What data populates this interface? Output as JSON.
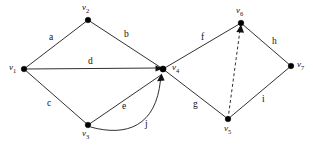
{
  "figure": {
    "type": "graph-diagram",
    "width": 313,
    "height": 150,
    "background_color": "#ffffff",
    "stroke_color": "#1a1a1a"
  },
  "vertices": [
    {
      "id": "v1",
      "name": "v",
      "sub": "1",
      "x": 24,
      "y": 69,
      "label_x": 9,
      "label_y": 63
    },
    {
      "id": "v2",
      "name": "v",
      "sub": "2",
      "x": 88,
      "y": 20,
      "label_x": 82,
      "label_y": 3
    },
    {
      "id": "v3",
      "name": "v",
      "sub": "3",
      "x": 88,
      "y": 125,
      "label_x": 82,
      "label_y": 129
    },
    {
      "id": "v4",
      "name": "v",
      "sub": "4",
      "x": 163,
      "y": 69,
      "label_x": 172,
      "label_y": 63
    },
    {
      "id": "v5",
      "name": "v",
      "sub": "5",
      "x": 228,
      "y": 119,
      "label_x": 224,
      "label_y": 124
    },
    {
      "id": "v6",
      "name": "v",
      "sub": "6",
      "x": 241,
      "y": 23,
      "label_x": 236,
      "label_y": 6
    },
    {
      "id": "v7",
      "name": "v",
      "sub": "7",
      "x": 291,
      "y": 66,
      "label_x": 297,
      "label_y": 60
    }
  ],
  "edges": [
    {
      "id": "a",
      "from": "v1",
      "to": "v2",
      "style": "solid",
      "directed": false,
      "label": "a",
      "label_x": 49,
      "label_y": 33
    },
    {
      "id": "b",
      "from": "v2",
      "to": "v4",
      "style": "solid",
      "directed": false,
      "label": "b",
      "label_x": 124,
      "label_y": 30
    },
    {
      "id": "c",
      "from": "v1",
      "to": "v3",
      "style": "solid",
      "directed": false,
      "label": "c",
      "label_x": 47,
      "label_y": 99
    },
    {
      "id": "d",
      "from": "v1",
      "to": "v4",
      "style": "solid",
      "directed": true,
      "label": "d",
      "label_x": 88,
      "label_y": 57
    },
    {
      "id": "e",
      "from": "v3",
      "to": "v4",
      "style": "solid",
      "directed": true,
      "label": "e",
      "label_x": 122,
      "label_y": 102
    },
    {
      "id": "j",
      "from": "v3",
      "to": "v4",
      "style": "curved",
      "directed": true,
      "label": "j",
      "label_x": 145,
      "label_y": 120
    },
    {
      "id": "f",
      "from": "v4",
      "to": "v6",
      "style": "solid",
      "directed": false,
      "label": "f",
      "label_x": 201,
      "label_y": 33
    },
    {
      "id": "g",
      "from": "v4",
      "to": "v5",
      "style": "solid",
      "directed": false,
      "label": "g",
      "label_x": 193,
      "label_y": 100
    },
    {
      "id": "h",
      "from": "v6",
      "to": "v7",
      "style": "solid",
      "directed": false,
      "label": "h",
      "label_x": 272,
      "label_y": 37
    },
    {
      "id": "i",
      "from": "v5",
      "to": "v7",
      "style": "solid",
      "directed": false,
      "label": "i",
      "label_x": 262,
      "label_y": 95
    },
    {
      "id": "k",
      "from": "v5",
      "to": "v6",
      "style": "dashed",
      "directed": true,
      "label": "",
      "label_x": 0,
      "label_y": 0
    }
  ]
}
